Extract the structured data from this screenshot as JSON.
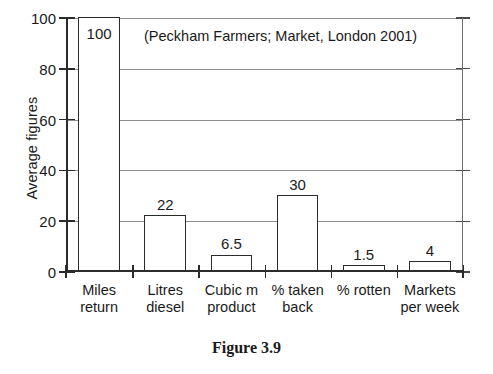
{
  "chart_data": {
    "type": "bar",
    "title": "(Peckham Farmers; Market, London 2001)",
    "xlabel": "",
    "ylabel": "Average figures",
    "ylim": [
      0,
      100
    ],
    "yticks": [
      0,
      20,
      40,
      60,
      80,
      100
    ],
    "grid": true,
    "legend": "none",
    "categories": [
      "Miles return",
      "Litres diesel",
      "Cubic m product",
      "% taken back",
      "% rotten",
      "Markets per week"
    ],
    "category_lines": [
      [
        "Miles",
        "return"
      ],
      [
        "Litres",
        "diesel"
      ],
      [
        "Cubic m",
        "product"
      ],
      [
        "% taken",
        "back"
      ],
      [
        "% rotten",
        ""
      ],
      [
        "Markets",
        "per week"
      ]
    ],
    "values": [
      100,
      22,
      6.5,
      30,
      1.5,
      4
    ],
    "value_labels": [
      "100",
      "22",
      "6.5",
      "30",
      "1.5",
      "4"
    ]
  },
  "caption": "Figure 3.9",
  "colors": {
    "bar_fill": "#ffffff",
    "bar_outline": "#2b2b2b",
    "gridline": "#8f8f8f",
    "axis": "#2b2b2b",
    "background": "#ffffff",
    "text": "#1a1a1a"
  }
}
